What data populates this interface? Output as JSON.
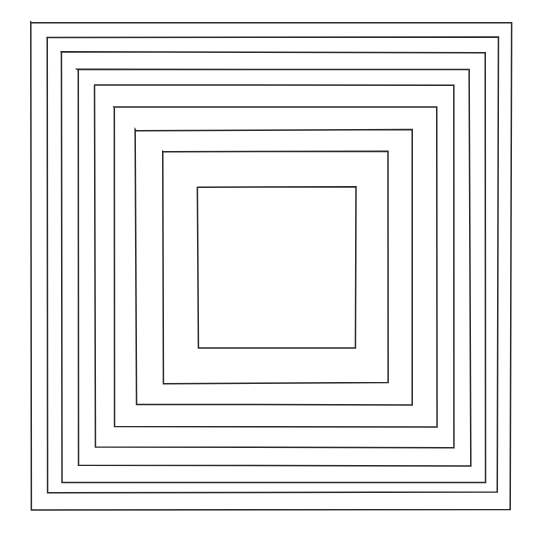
{
  "figure": {
    "canvas": {
      "width": 541,
      "height": 538
    },
    "background_color": "#ffffff",
    "stroke_color": "#2b2b2b",
    "stroke_width": 1.5,
    "square_count": 9
  },
  "chart_data": {
    "type": "line",
    "subtitle": "",
    "xlabel": "",
    "ylabel": "",
    "grid": false,
    "legend_position": "none",
    "xlim": [
      0,
      541
    ],
    "ylim": [
      0,
      538
    ],
    "axis_visible": false,
    "tick_labels_x": [],
    "tick_labels_y": [],
    "annotations": [],
    "series": [
      {
        "name": "square-1-outermost",
        "index": 1,
        "left": 31,
        "top": 22,
        "right": 511,
        "bottom": 510,
        "width": 480,
        "height": 488,
        "points": [
          [
            31,
            22
          ],
          [
            511,
            22
          ],
          [
            511,
            510
          ],
          [
            31,
            510
          ],
          [
            31,
            22
          ]
        ]
      },
      {
        "name": "square-2",
        "index": 2,
        "left": 47,
        "top": 37,
        "right": 498,
        "bottom": 493,
        "width": 451,
        "height": 456,
        "points": [
          [
            47,
            37
          ],
          [
            498,
            37
          ],
          [
            498,
            493
          ],
          [
            47,
            493
          ],
          [
            47,
            37
          ]
        ]
      },
      {
        "name": "square-3",
        "index": 3,
        "left": 62,
        "top": 52,
        "right": 486,
        "bottom": 482,
        "width": 424,
        "height": 430,
        "points": [
          [
            62,
            52
          ],
          [
            486,
            52
          ],
          [
            486,
            482
          ],
          [
            62,
            482
          ],
          [
            62,
            52
          ]
        ]
      },
      {
        "name": "square-4",
        "index": 4,
        "left": 78,
        "top": 70,
        "right": 470,
        "bottom": 465,
        "width": 392,
        "height": 395,
        "points": [
          [
            78,
            70
          ],
          [
            470,
            70
          ],
          [
            470,
            465
          ],
          [
            78,
            465
          ],
          [
            78,
            70
          ]
        ]
      },
      {
        "name": "square-5",
        "index": 5,
        "left": 95,
        "top": 85,
        "right": 454,
        "bottom": 447,
        "width": 359,
        "height": 362,
        "points": [
          [
            95,
            85
          ],
          [
            454,
            85
          ],
          [
            454,
            447
          ],
          [
            95,
            447
          ],
          [
            95,
            85
          ]
        ]
      },
      {
        "name": "square-6",
        "index": 6,
        "left": 114,
        "top": 107,
        "right": 437,
        "bottom": 427,
        "width": 323,
        "height": 320,
        "points": [
          [
            114,
            107
          ],
          [
            437,
            107
          ],
          [
            437,
            427
          ],
          [
            114,
            427
          ],
          [
            114,
            107
          ]
        ]
      },
      {
        "name": "square-7",
        "index": 7,
        "left": 136,
        "top": 130,
        "right": 413,
        "bottom": 405,
        "width": 277,
        "height": 275,
        "points": [
          [
            136,
            130
          ],
          [
            413,
            130
          ],
          [
            413,
            405
          ],
          [
            136,
            405
          ],
          [
            136,
            130
          ]
        ]
      },
      {
        "name": "square-8",
        "index": 8,
        "left": 163,
        "top": 152,
        "right": 388,
        "bottom": 383,
        "width": 225,
        "height": 231,
        "points": [
          [
            163,
            152
          ],
          [
            388,
            152
          ],
          [
            388,
            383
          ],
          [
            163,
            383
          ],
          [
            163,
            152
          ]
        ]
      },
      {
        "name": "square-9-innermost",
        "index": 9,
        "left": 198,
        "top": 187,
        "right": 356,
        "bottom": 348,
        "width": 158,
        "height": 161,
        "points": [
          [
            198,
            187
          ],
          [
            356,
            187
          ],
          [
            356,
            348
          ],
          [
            198,
            348
          ],
          [
            198,
            187
          ]
        ]
      }
    ]
  }
}
